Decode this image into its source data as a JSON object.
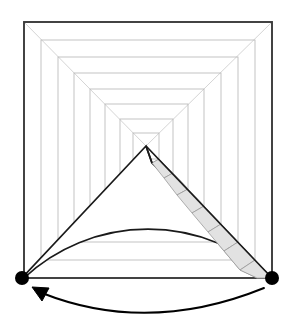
{
  "figure": {
    "canvas": {
      "width": 292,
      "height": 332,
      "background": "#ffffff"
    },
    "colors": {
      "outer_frame_stroke": "#3a3a3a",
      "nested_square_stroke": "#b9b9b9",
      "diagonal_stroke": "#c9c9c9",
      "step_fill": "#e2e2e2",
      "step_stroke": "#9a9a9a",
      "wedge_fill": "#ffffff",
      "wedge_stroke": "#1a1a1a",
      "pivot_dot_fill": "#000000",
      "arc_arrow_stroke": "#000000"
    },
    "vanishing_point": {
      "x": 146,
      "y": 146,
      "label": "vanishing-point"
    },
    "outer_frame": {
      "left": 24,
      "top": 22,
      "right": 272,
      "bottom": 278
    },
    "nested_squares": [
      {
        "index": 0,
        "left": 24,
        "top": 22,
        "right": 272,
        "bottom": 278,
        "outer": true
      },
      {
        "index": 1,
        "left": 41,
        "top": 40,
        "right": 255,
        "bottom": 260,
        "outer": false
      },
      {
        "index": 2,
        "left": 58,
        "top": 57,
        "right": 238,
        "bottom": 242,
        "outer": false
      },
      {
        "index": 3,
        "left": 74,
        "top": 73,
        "right": 221,
        "bottom": 224,
        "outer": false
      },
      {
        "index": 4,
        "left": 90,
        "top": 89,
        "right": 204,
        "bottom": 206,
        "outer": false
      },
      {
        "index": 5,
        "left": 105,
        "top": 104,
        "right": 188,
        "bottom": 189,
        "outer": false
      },
      {
        "index": 6,
        "left": 120,
        "top": 119,
        "right": 173,
        "bottom": 173,
        "outer": false
      },
      {
        "index": 7,
        "left": 133,
        "top": 133,
        "right": 159,
        "bottom": 159,
        "outer": false
      }
    ],
    "corner_diagonals": [
      {
        "name": "diagonal-top-left",
        "x1": 24,
        "y1": 22,
        "x2": 146,
        "y2": 146
      },
      {
        "name": "diagonal-top-right",
        "x1": 272,
        "y1": 22,
        "x2": 146,
        "y2": 146
      },
      {
        "name": "diagonal-bottom-left",
        "x1": 24,
        "y1": 278,
        "x2": 146,
        "y2": 146
      },
      {
        "name": "diagonal-bottom-right",
        "x1": 272,
        "y1": 278,
        "x2": 146,
        "y2": 146
      }
    ],
    "stair_flight": {
      "name": "shaded-staircase",
      "from": {
        "x": 146,
        "y": 146
      },
      "to": {
        "x": 272,
        "y": 278
      },
      "step_count": 7,
      "steps": [
        {
          "index": 1,
          "points": "152,163 159,159 173,173 164,178"
        },
        {
          "index": 2,
          "points": "164,178 173,173 188,189 177,195"
        },
        {
          "index": 3,
          "points": "177,195 188,189 204,206 192,213"
        },
        {
          "index": 4,
          "points": "192,213 204,206 221,224 208,232"
        },
        {
          "index": 5,
          "points": "208,232 221,224 238,242 224,251"
        },
        {
          "index": 6,
          "points": "224,251 238,242 255,260 240,270"
        },
        {
          "index": 7,
          "points": "240,270 255,260 272,278 257,278"
        }
      ]
    },
    "sweep_wedge": {
      "name": "swept-sector",
      "apex": {
        "x": 146,
        "y": 146
      },
      "left_arm_end": {
        "x": 22,
        "y": 278
      },
      "right_arm_end": {
        "x": 272,
        "y": 278
      },
      "riser": {
        "x1": 146,
        "y1": 146,
        "x2": 152,
        "y2": 163
      },
      "outline_path": "M 146 146 L 22 278 L 24 278 A 182 182 0 0 1 272 278 L 152 163 Z"
    },
    "pivot_dots": [
      {
        "name": "pivot-dot-left",
        "cx": 22,
        "cy": 278,
        "r": 7
      },
      {
        "name": "pivot-dot-right",
        "cx": 272,
        "cy": 278,
        "r": 7
      }
    ],
    "rotation_arrow": {
      "name": "rotation-arc-arrow",
      "direction": "counter-clockwise",
      "path": "M 264 288 Q 148 335 42 293",
      "arrowhead_points": "32,287 49,288 42,301",
      "start": {
        "x": 264,
        "y": 288
      },
      "end": {
        "x": 42,
        "y": 293
      }
    }
  }
}
